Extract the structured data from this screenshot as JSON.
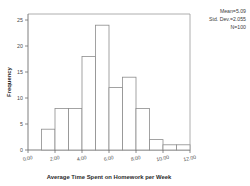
{
  "chart_data": {
    "type": "bar",
    "title": "",
    "xlabel": "Average Time Spent on Homework per Week",
    "ylabel": "Frequency",
    "xlim": [
      0,
      12
    ],
    "ylim": [
      0,
      25
    ],
    "grid": false,
    "bin_width": 1.0,
    "bin_starts": [
      0,
      1,
      2,
      3,
      4,
      5,
      6,
      7,
      8,
      9,
      10,
      11
    ],
    "categories": [
      "0-1",
      "1-2",
      "2-3",
      "3-4",
      "4-5",
      "5-6",
      "6-7",
      "7-8",
      "8-9",
      "9-10",
      "10-11",
      "11-12"
    ],
    "values": [
      0,
      4,
      8,
      8,
      18,
      24,
      12,
      14,
      8,
      2,
      1,
      1
    ],
    "xticks": [
      0,
      2,
      4,
      6,
      8,
      10,
      12
    ],
    "xtick_labels": [
      "0.00",
      "2.00",
      "4.00",
      "6.00",
      "8.00",
      "10.00",
      "12.00"
    ],
    "yticks": [
      0,
      5,
      10,
      15,
      20,
      25
    ],
    "ytick_labels": [
      "0",
      "5",
      "10",
      "15",
      "20",
      "25"
    ],
    "bar_fill_color": "#ffffff",
    "bar_edge_color": "#8c8c8c",
    "axis_color": "#6f6f6f"
  },
  "annotations": {
    "mean_label": "Mean=5.09",
    "std_dev_label": "Std. Dev.=2.055",
    "n_label": "N=100"
  }
}
